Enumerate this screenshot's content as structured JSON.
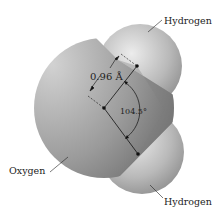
{
  "diagram": {
    "labels": {
      "hydrogen_top": "Hydrogen",
      "hydrogen_bottom": "Hydrogen",
      "oxygen": "Oxygen",
      "bond_length": "0.96 Å",
      "bond_angle": "104.5°"
    },
    "atoms": [
      {
        "name": "Oxygen",
        "cx": 104,
        "cy": 108,
        "r": 70
      },
      {
        "name": "Hydrogen",
        "cx": 140,
        "cy": 66,
        "r": 42
      },
      {
        "name": "Hydrogen",
        "cx": 142,
        "cy": 152,
        "r": 42
      }
    ],
    "colors": {
      "oxygen_light": "#c9c9c9",
      "oxygen_dark": "#6e6e6e",
      "hydrogen_light": "#e4e4e4",
      "hydrogen_dark": "#8a8a8a",
      "line": "#111111"
    }
  }
}
